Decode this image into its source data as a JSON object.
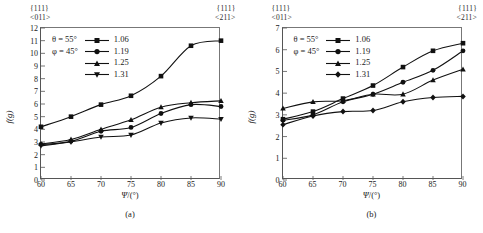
{
  "figure": {
    "panels": [
      {
        "id": "a",
        "caption": "(a)",
        "corner_top_left": {
          "plane": "{111}",
          "direction": "<011>"
        },
        "corner_top_right": {
          "plane": "{111}",
          "direction": "<211>"
        },
        "conditions": {
          "theta": "θ = 55°",
          "phi": "φ = 45°"
        },
        "chart_data": {
          "type": "line",
          "title": "",
          "xlabel": "Ψ/(°)",
          "ylabel": "f(g)",
          "xlim": [
            60,
            90
          ],
          "ylim": [
            0,
            12
          ],
          "xticks": [
            60,
            65,
            70,
            75,
            80,
            85,
            90
          ],
          "yticks": [
            0,
            1,
            2,
            3,
            4,
            5,
            6,
            7,
            8,
            9,
            10,
            11,
            12
          ],
          "grid": false,
          "legend_position": "top-left",
          "x": [
            60,
            65,
            70,
            75,
            80,
            85,
            90
          ],
          "series": [
            {
              "name": "1.06",
              "marker": "square",
              "values": [
                4.2,
                5.0,
                5.95,
                6.65,
                8.2,
                10.6,
                11.0
              ]
            },
            {
              "name": "1.19",
              "marker": "circle",
              "values": [
                2.8,
                3.05,
                3.85,
                4.15,
                5.25,
                5.95,
                5.8
              ]
            },
            {
              "name": "1.25",
              "marker": "triangle-up",
              "values": [
                2.85,
                3.2,
                4.0,
                4.75,
                5.75,
                6.1,
                6.25
              ]
            },
            {
              "name": "1.31",
              "marker": "triangle-down",
              "values": [
                2.7,
                3.0,
                3.4,
                3.55,
                4.5,
                4.9,
                4.8
              ]
            }
          ]
        }
      },
      {
        "id": "b",
        "caption": "(b)",
        "corner_top_left": {
          "plane": "{111}",
          "direction": "<011>"
        },
        "corner_top_right": {
          "plane": "{111}",
          "direction": "<211>"
        },
        "conditions": {
          "theta": "θ = 55°",
          "phi": "φ = 45°"
        },
        "chart_data": {
          "type": "line",
          "title": "",
          "xlabel": "Ψ/(°)",
          "ylabel": "f(g)",
          "xlim": [
            60,
            90
          ],
          "ylim": [
            0,
            7
          ],
          "xticks": [
            60,
            65,
            70,
            75,
            80,
            85,
            90
          ],
          "yticks": [
            0,
            1,
            2,
            3,
            4,
            5,
            6,
            7
          ],
          "grid": false,
          "legend_position": "top-left",
          "x": [
            60,
            65,
            70,
            75,
            80,
            85,
            90
          ],
          "series": [
            {
              "name": "1.06",
              "marker": "square",
              "values": [
                2.8,
                3.15,
                3.75,
                4.35,
                5.2,
                5.95,
                6.3
              ]
            },
            {
              "name": "1.19",
              "marker": "circle",
              "values": [
                2.75,
                3.0,
                3.6,
                3.95,
                4.5,
                5.05,
                5.95
              ]
            },
            {
              "name": "1.25",
              "marker": "triangle-up",
              "values": [
                3.3,
                3.6,
                3.65,
                3.95,
                3.95,
                4.6,
                5.1
              ]
            },
            {
              "name": "1.31",
              "marker": "diamond",
              "values": [
                2.55,
                2.95,
                3.15,
                3.2,
                3.6,
                3.8,
                3.85
              ]
            }
          ]
        }
      }
    ]
  }
}
